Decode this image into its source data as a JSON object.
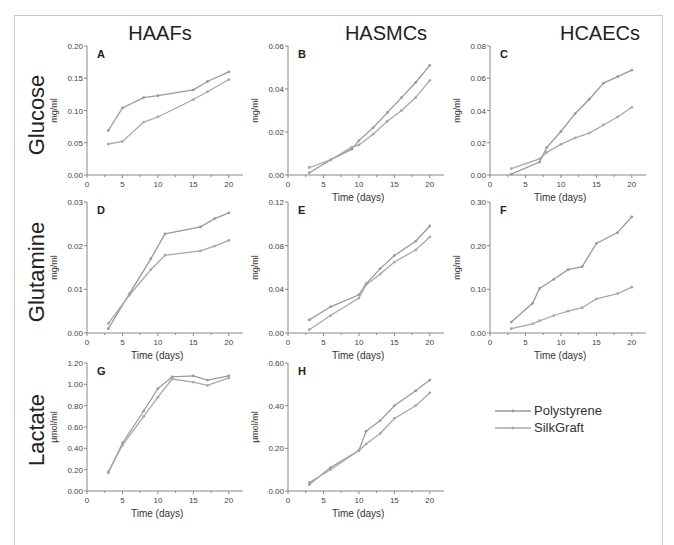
{
  "figure": {
    "column_titles": [
      "HAAFs",
      "HASMCs",
      "HCAECs"
    ],
    "row_titles": [
      "Glucose",
      "Glutamine",
      "Lactate"
    ],
    "legend": [
      {
        "label": "Polystyrene",
        "color": "#9a9a9a"
      },
      {
        "label": "SilkGraft",
        "color": "#a8a8a8"
      }
    ]
  },
  "chart_data": [
    {
      "panel": "A",
      "type": "line",
      "row": "Glucose",
      "column": "HAAFs",
      "xlabel": "",
      "ylabel": "mg/ml",
      "xlim": [
        0,
        22
      ],
      "xticks": [
        0,
        5,
        10,
        15,
        20
      ],
      "ylim": [
        0,
        0.2
      ],
      "yticks": [
        "0.00",
        "0.05",
        "0.10",
        "0.15",
        "0.20"
      ],
      "series": [
        {
          "name": "Polystyrene",
          "x": [
            3,
            5,
            8,
            10,
            15,
            17,
            20
          ],
          "values": [
            0.069,
            0.104,
            0.12,
            0.123,
            0.132,
            0.145,
            0.16
          ]
        },
        {
          "name": "SilkGraft",
          "x": [
            3,
            5,
            8,
            10,
            15,
            17,
            20
          ],
          "values": [
            0.048,
            0.052,
            0.082,
            0.09,
            0.117,
            0.129,
            0.148
          ]
        }
      ]
    },
    {
      "panel": "B",
      "type": "line",
      "row": "Glucose",
      "column": "HASMCs",
      "xlabel": "Time (days)",
      "ylabel": "mg/ml",
      "xlim": [
        0,
        22
      ],
      "xticks": [
        0,
        5,
        10,
        15,
        20
      ],
      "ylim": [
        0,
        0.06
      ],
      "yticks": [
        "0.00",
        "0.02",
        "0.04",
        "0.06"
      ],
      "series": [
        {
          "name": "Polystyrene",
          "x": [
            3,
            6,
            9,
            10,
            12,
            14,
            16,
            18,
            20
          ],
          "values": [
            0.001,
            0.007,
            0.012,
            0.016,
            0.022,
            0.029,
            0.036,
            0.043,
            0.051
          ]
        },
        {
          "name": "SilkGraft",
          "x": [
            3,
            6,
            9,
            10,
            12,
            14,
            16,
            18,
            20
          ],
          "values": [
            0.0035,
            0.007,
            0.013,
            0.014,
            0.019,
            0.025,
            0.03,
            0.036,
            0.044
          ]
        }
      ]
    },
    {
      "panel": "C",
      "type": "line",
      "row": "Glucose",
      "column": "HCAECs",
      "xlabel": "Time (days)",
      "ylabel": "mg/ml",
      "xlim": [
        0,
        22
      ],
      "xticks": [
        0,
        5,
        10,
        15,
        20
      ],
      "ylim": [
        0,
        0.08
      ],
      "yticks": [
        "0.00",
        "0.02",
        "0.04",
        "0.06",
        "0.08"
      ],
      "series": [
        {
          "name": "Polystyrene",
          "x": [
            3,
            7,
            8,
            10,
            12,
            14,
            16,
            18,
            20
          ],
          "values": [
            0.0005,
            0.008,
            0.017,
            0.027,
            0.038,
            0.047,
            0.057,
            0.061,
            0.065
          ]
        },
        {
          "name": "SilkGraft",
          "x": [
            3,
            7,
            8,
            10,
            12,
            14,
            16,
            18,
            20
          ],
          "values": [
            0.004,
            0.01,
            0.014,
            0.019,
            0.023,
            0.026,
            0.031,
            0.036,
            0.042
          ]
        }
      ]
    },
    {
      "panel": "D",
      "type": "line",
      "row": "Glutamine",
      "column": "HAAFs",
      "xlabel": "Time (days)",
      "ylabel": "mg/ml",
      "xlim": [
        0,
        22
      ],
      "xticks": [
        0,
        5,
        10,
        15,
        20
      ],
      "ylim": [
        0,
        0.03
      ],
      "yticks": [
        "0.00",
        "0.01",
        "0.02",
        "0.03"
      ],
      "series": [
        {
          "name": "Polystyrene",
          "x": [
            3,
            6,
            9,
            11,
            16,
            18,
            20
          ],
          "values": [
            0.001,
            0.009,
            0.017,
            0.0227,
            0.0243,
            0.0262,
            0.0275
          ]
        },
        {
          "name": "SilkGraft",
          "x": [
            3,
            6,
            9,
            11,
            16,
            18,
            20
          ],
          "values": [
            0.0022,
            0.0087,
            0.0145,
            0.0178,
            0.0188,
            0.0199,
            0.0212
          ]
        }
      ]
    },
    {
      "panel": "E",
      "type": "line",
      "row": "Glutamine",
      "column": "HASMCs",
      "xlabel": "Time (days)",
      "ylabel": "mg/ml",
      "xlim": [
        0,
        22
      ],
      "xticks": [
        0,
        5,
        10,
        15,
        20
      ],
      "ylim": [
        0,
        0.12
      ],
      "yticks": [
        "0.00",
        "0.04",
        "0.08",
        "0.12"
      ],
      "series": [
        {
          "name": "Polystyrene",
          "x": [
            3,
            6,
            10,
            11,
            13,
            15,
            18,
            20
          ],
          "values": [
            0.012,
            0.024,
            0.035,
            0.045,
            0.059,
            0.071,
            0.084,
            0.098
          ]
        },
        {
          "name": "SilkGraft",
          "x": [
            3,
            6,
            10,
            11,
            13,
            15,
            18,
            20
          ],
          "values": [
            0.003,
            0.016,
            0.032,
            0.044,
            0.054,
            0.065,
            0.076,
            0.088
          ]
        }
      ]
    },
    {
      "panel": "F",
      "type": "line",
      "row": "Glutamine",
      "column": "HCAECs",
      "xlabel": "Time (days)",
      "ylabel": "mg/ml",
      "xlim": [
        0,
        22
      ],
      "xticks": [
        0,
        5,
        10,
        15,
        20
      ],
      "ylim": [
        0,
        0.3
      ],
      "yticks": [
        "0.00",
        "0.10",
        "0.20",
        "0.30"
      ],
      "series": [
        {
          "name": "Polystyrene",
          "x": [
            3,
            6,
            7,
            9,
            11,
            13,
            15,
            18,
            20
          ],
          "values": [
            0.025,
            0.068,
            0.102,
            0.123,
            0.145,
            0.152,
            0.205,
            0.23,
            0.266
          ]
        },
        {
          "name": "SilkGraft",
          "x": [
            3,
            6,
            7,
            9,
            11,
            13,
            15,
            18,
            20
          ],
          "values": [
            0.01,
            0.021,
            0.028,
            0.04,
            0.05,
            0.058,
            0.078,
            0.09,
            0.105
          ]
        }
      ]
    },
    {
      "panel": "G",
      "type": "line",
      "row": "Lactate",
      "column": "HAAFs",
      "xlabel": "Time (days)",
      "ylabel": "µmol/ml",
      "xlim": [
        0,
        22
      ],
      "xticks": [
        0,
        5,
        10,
        15,
        20
      ],
      "ylim": [
        0,
        1.2
      ],
      "yticks": [
        "0.00",
        "0.20",
        "0.40",
        "0.60",
        "0.80",
        "1.00",
        "1.20"
      ],
      "series": [
        {
          "name": "Polystyrene",
          "x": [
            3,
            5,
            8,
            10,
            12,
            15,
            17,
            20
          ],
          "values": [
            0.17,
            0.45,
            0.75,
            0.96,
            1.07,
            1.08,
            1.04,
            1.08
          ]
        },
        {
          "name": "SilkGraft",
          "x": [
            3,
            5,
            8,
            10,
            12,
            15,
            17,
            20
          ],
          "values": [
            0.18,
            0.43,
            0.7,
            0.88,
            1.05,
            1.02,
            0.99,
            1.06
          ]
        }
      ]
    },
    {
      "panel": "H",
      "type": "line",
      "row": "Lactate",
      "column": "HASMCs",
      "xlabel": "Time (days)",
      "ylabel": "µmol/ml",
      "xlim": [
        0,
        22
      ],
      "xticks": [
        0,
        5,
        10,
        15,
        20
      ],
      "ylim": [
        0,
        0.6
      ],
      "yticks": [
        "0.00",
        "0.20",
        "0.40",
        "0.60"
      ],
      "series": [
        {
          "name": "Polystyrene",
          "x": [
            3,
            6,
            10,
            11,
            13,
            15,
            18,
            20
          ],
          "values": [
            0.03,
            0.11,
            0.19,
            0.28,
            0.33,
            0.4,
            0.47,
            0.52
          ]
        },
        {
          "name": "SilkGraft",
          "x": [
            3,
            6,
            10,
            11,
            13,
            15,
            18,
            20
          ],
          "values": [
            0.04,
            0.1,
            0.19,
            0.22,
            0.27,
            0.34,
            0.4,
            0.46
          ]
        }
      ]
    }
  ]
}
